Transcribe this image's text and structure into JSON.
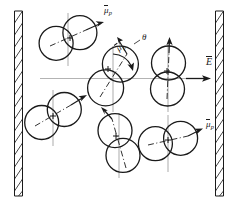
{
  "figure": {
    "background_color": "#ffffff",
    "ink_color": "#1a1a1a",
    "guide_color": "#b3b3b3",
    "width": 239,
    "height": 206
  },
  "labels": {
    "field_label": "E",
    "angle_label": "θ",
    "mu_symbol": "μ",
    "mu_subscript": "p",
    "dipole_top_left": {
      "symbol": "μ",
      "subscript": "p",
      "x": 104,
      "y": 10
    },
    "dipole_center": {
      "symbol": "μ",
      "subscript": "p",
      "x": 121,
      "y": 41
    },
    "dipole_bottom_right": {
      "symbol": "μ",
      "subscript": "p",
      "x": 207,
      "y": 124
    },
    "theta": {
      "text": "θ",
      "x": 142,
      "y": 39
    },
    "field": {
      "text": "E",
      "x": 207,
      "y": 62
    }
  },
  "walls": {
    "name": "capacitor-plates",
    "hatched": true,
    "left": {
      "x_outer": 14,
      "x_inner": 22,
      "y_top": 11,
      "y_bottom": 196
    },
    "right": {
      "x_outer": 215,
      "x_inner": 223,
      "y_top": 11,
      "y_bottom": 196
    },
    "hatch_count": 15
  },
  "field_axis": {
    "name": "field-axis-line",
    "x_start": 40,
    "x_end": 200,
    "y": 78,
    "arrow": true,
    "color": "#b3b3b3",
    "arrow_color": "#1a1a1a"
  },
  "molecules": [
    {
      "id": "molecule-top-left",
      "cx": 68,
      "cy": 38,
      "angle_deg": -24,
      "lobe_radius": 17,
      "lobe_offset": 13,
      "has_plus": true,
      "plus_offset": 7,
      "vertical_guide": true,
      "dipole_arrow": {
        "length": 30,
        "angle_deg": -24,
        "labeled": true
      }
    },
    {
      "id": "molecule-center",
      "cx": 113,
      "cy": 76,
      "angle_deg": -58,
      "lobe_radius": 18,
      "lobe_offset": 14,
      "has_plus": true,
      "plus_offset": 7,
      "vertical_guide": true,
      "dipole_arrow": {
        "length": 32,
        "angle_deg": -58,
        "labeled": true
      },
      "angle_arc": {
        "from_deg": -90,
        "to_deg": -58,
        "radius": 22
      }
    },
    {
      "id": "molecule-right-middle",
      "cx": 168,
      "cy": 76,
      "angle_deg": -88,
      "lobe_radius": 17,
      "lobe_offset": 13,
      "has_plus": true,
      "plus_offset": 6,
      "vertical_guide": true,
      "dipole_arrow": {
        "length": 27,
        "angle_deg": -88,
        "labeled": false
      }
    },
    {
      "id": "molecule-left-lower",
      "cx": 53,
      "cy": 116,
      "angle_deg": -30,
      "lobe_radius": 17,
      "lobe_offset": 13,
      "has_plus": true,
      "plus_offset": 7,
      "vertical_guide": true,
      "dipole_arrow": {
        "length": 30,
        "angle_deg": -30,
        "labeled": false
      }
    },
    {
      "id": "molecule-bottom-center",
      "cx": 119,
      "cy": 143,
      "angle_deg": -72,
      "lobe_radius": 17,
      "lobe_offset": 13,
      "has_plus": true,
      "plus_offset": 7,
      "vertical_guide": true,
      "dipole_arrow": {
        "length": 28,
        "angle_deg": 118,
        "labeled": false
      }
    },
    {
      "id": "molecule-bottom-right",
      "cx": 168,
      "cy": 141,
      "angle_deg": -12,
      "lobe_radius": 17,
      "lobe_offset": 13,
      "has_plus": true,
      "plus_offset": 7,
      "vertical_guide": true,
      "dipole_arrow": {
        "length": 30,
        "angle_deg": -12,
        "labeled": true
      }
    }
  ]
}
